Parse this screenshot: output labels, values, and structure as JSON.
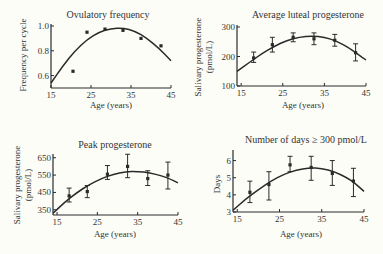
{
  "figure": {
    "background": "#fdfdf8",
    "ink": "#2a2a2a"
  },
  "chart_data": [
    {
      "type": "line",
      "title": "Ovulatory frequency",
      "xlabel": "Age (years)",
      "ylabel": "Frequency per cycle",
      "xlim": [
        15,
        45
      ],
      "ylim": [
        0.5,
        1.0
      ],
      "xticks": [
        15,
        25,
        35,
        45
      ],
      "yticks": [
        0.6,
        0.8,
        1.0
      ],
      "ytick_labels": [
        "0.6",
        "0.8",
        "1.0"
      ],
      "grid": false,
      "points": [
        {
          "x": 20.5,
          "y": 0.635
        },
        {
          "x": 24,
          "y": 0.95
        },
        {
          "x": 28.5,
          "y": 0.975
        },
        {
          "x": 33,
          "y": 0.965
        },
        {
          "x": 37.5,
          "y": 0.9
        },
        {
          "x": 42.5,
          "y": 0.84
        }
      ],
      "fit_curve": [
        {
          "x": 15,
          "y": 0.54
        },
        {
          "x": 18,
          "y": 0.68
        },
        {
          "x": 21,
          "y": 0.8
        },
        {
          "x": 24,
          "y": 0.89
        },
        {
          "x": 27,
          "y": 0.95
        },
        {
          "x": 30,
          "y": 0.98
        },
        {
          "x": 33,
          "y": 0.985
        },
        {
          "x": 36,
          "y": 0.96
        },
        {
          "x": 39,
          "y": 0.9
        },
        {
          "x": 42,
          "y": 0.82
        },
        {
          "x": 45,
          "y": 0.72
        }
      ]
    },
    {
      "type": "line",
      "title": "Average luteal progesterone",
      "xlabel": "Age (years)",
      "ylabel": [
        "Salivary progesterone",
        "(pmol/L)"
      ],
      "xlim": [
        14,
        45
      ],
      "ylim": [
        100,
        300
      ],
      "xticks": [
        15,
        25,
        35,
        45
      ],
      "yticks": [
        100,
        200,
        300
      ],
      "ytick_labels": [
        "100",
        "200",
        "300"
      ],
      "grid": false,
      "points": [
        {
          "x": 18,
          "y": 195,
          "err": [
            180,
            215
          ]
        },
        {
          "x": 22.5,
          "y": 240,
          "err": [
            215,
            265
          ]
        },
        {
          "x": 27.5,
          "y": 265,
          "err": [
            250,
            280
          ]
        },
        {
          "x": 32.5,
          "y": 260,
          "err": [
            240,
            280
          ]
        },
        {
          "x": 37.5,
          "y": 255,
          "err": [
            235,
            275
          ]
        },
        {
          "x": 42.5,
          "y": 213,
          "err": [
            185,
            243
          ]
        }
      ],
      "fit_curve": [
        {
          "x": 14,
          "y": 150
        },
        {
          "x": 17,
          "y": 180
        },
        {
          "x": 20,
          "y": 210
        },
        {
          "x": 23,
          "y": 235
        },
        {
          "x": 26,
          "y": 255
        },
        {
          "x": 29,
          "y": 266
        },
        {
          "x": 32,
          "y": 270
        },
        {
          "x": 35,
          "y": 266
        },
        {
          "x": 38,
          "y": 252
        },
        {
          "x": 41,
          "y": 228
        },
        {
          "x": 43,
          "y": 208
        },
        {
          "x": 45,
          "y": 188
        }
      ]
    },
    {
      "type": "line",
      "title": "Peak progesterone",
      "xlabel": "Age (years)",
      "ylabel": [
        "Salivary progesterone",
        "(pmol/L)"
      ],
      "xlim": [
        14,
        45
      ],
      "ylim": [
        320,
        660
      ],
      "xticks": [
        15,
        25,
        35,
        45
      ],
      "yticks": [
        350,
        450,
        550,
        650
      ],
      "ytick_labels": [
        "350",
        "450",
        "550",
        "650"
      ],
      "grid": false,
      "points": [
        {
          "x": 18,
          "y": 430,
          "err": [
            395,
            475
          ]
        },
        {
          "x": 22.5,
          "y": 455,
          "err": [
            420,
            490
          ]
        },
        {
          "x": 27.5,
          "y": 555,
          "err": [
            525,
            605
          ]
        },
        {
          "x": 32.5,
          "y": 600,
          "err": [
            535,
            670
          ]
        },
        {
          "x": 37.5,
          "y": 530,
          "err": [
            490,
            575
          ]
        },
        {
          "x": 42.5,
          "y": 550,
          "err": [
            470,
            625
          ]
        }
      ],
      "fit_curve": [
        {
          "x": 14,
          "y": 330
        },
        {
          "x": 17,
          "y": 395
        },
        {
          "x": 20,
          "y": 450
        },
        {
          "x": 23,
          "y": 495
        },
        {
          "x": 26,
          "y": 530
        },
        {
          "x": 29,
          "y": 555
        },
        {
          "x": 32,
          "y": 570
        },
        {
          "x": 35,
          "y": 572
        },
        {
          "x": 38,
          "y": 563
        },
        {
          "x": 41,
          "y": 545
        },
        {
          "x": 43,
          "y": 528
        },
        {
          "x": 45,
          "y": 505
        }
      ]
    },
    {
      "type": "line",
      "title": "Number of days ≥ 300 pmol/L",
      "xlabel": "Age (years)",
      "ylabel": "Days",
      "xlim": [
        14,
        45
      ],
      "ylim": [
        3,
        6.5
      ],
      "xticks": [
        15,
        25,
        35,
        45
      ],
      "yticks": [
        3,
        4,
        5,
        6
      ],
      "ytick_labels": [
        "3",
        "4",
        "5",
        "6"
      ],
      "grid": false,
      "points": [
        {
          "x": 18,
          "y": 4.15,
          "err": [
            3.55,
            4.8
          ]
        },
        {
          "x": 22.5,
          "y": 4.6,
          "err": [
            3.7,
            5.35
          ]
        },
        {
          "x": 27.5,
          "y": 5.75,
          "err": [
            5.35,
            6.25
          ]
        },
        {
          "x": 32.5,
          "y": 5.6,
          "err": [
            4.85,
            6.25
          ]
        },
        {
          "x": 37.5,
          "y": 5.25,
          "err": [
            4.55,
            6.0
          ]
        },
        {
          "x": 42.5,
          "y": 4.8,
          "err": [
            3.9,
            5.55
          ]
        }
      ],
      "fit_curve": [
        {
          "x": 14,
          "y": 3.1
        },
        {
          "x": 17,
          "y": 3.75
        },
        {
          "x": 20,
          "y": 4.3
        },
        {
          "x": 23,
          "y": 4.8
        },
        {
          "x": 26,
          "y": 5.2
        },
        {
          "x": 29,
          "y": 5.45
        },
        {
          "x": 32,
          "y": 5.58
        },
        {
          "x": 35,
          "y": 5.55
        },
        {
          "x": 38,
          "y": 5.35
        },
        {
          "x": 41,
          "y": 5.0
        },
        {
          "x": 43,
          "y": 4.65
        },
        {
          "x": 45,
          "y": 4.2
        }
      ]
    }
  ],
  "layout": {
    "panels": [
      {
        "px": {
          "left": 51,
          "right": 171,
          "top": 26,
          "bottom": 88
        },
        "title_pos": [
          108,
          18
        ],
        "ylabel_x": 26,
        "ylabel_center": 55,
        "xlabel_pos": [
          111,
          108
        ]
      },
      {
        "px": {
          "left": 237,
          "right": 366,
          "top": 27,
          "bottom": 86
        },
        "title_pos": [
          308,
          18
        ],
        "ylabel_x": 201,
        "ylabel_x2": 212,
        "ylabel_center": 57,
        "xlabel_pos": [
          303,
          108
        ]
      },
      {
        "px": {
          "left": 53,
          "right": 178,
          "top": 156,
          "bottom": 215
        },
        "title_pos": [
          115,
          148
        ],
        "ylabel_x": 20,
        "ylabel_x2": 31,
        "ylabel_center": 185,
        "xlabel_pos": [
          115,
          237
        ]
      },
      {
        "px": {
          "left": 233,
          "right": 364,
          "top": 152,
          "bottom": 212
        },
        "title_pos": [
          306,
          143
        ],
        "ylabel_x": 220,
        "ylabel_center": 184,
        "xlabel_pos": [
          301,
          237
        ]
      }
    ]
  }
}
